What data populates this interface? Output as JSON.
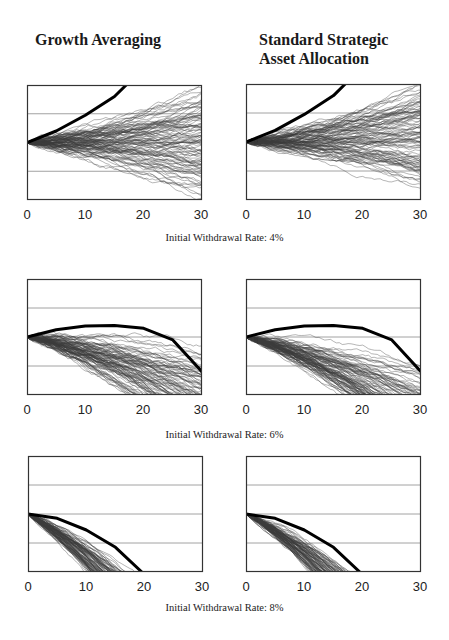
{
  "headers": {
    "left": "Growth Averaging",
    "right": "Standard Strategic Asset Allocation"
  },
  "captions": [
    "Initial Withdrawal Rate: 4%",
    "Initial Withdrawal Rate: 6%",
    "Initial Withdrawal Rate: 8%"
  ],
  "x_ticks": [
    "0",
    "10",
    "20",
    "30"
  ],
  "colors": {
    "paths": "#3a3a3a",
    "median": "#000000",
    "frame": "#333333",
    "grid": "#8a8a8a"
  },
  "chart_data": [
    {
      "type": "line",
      "title": "Growth Averaging",
      "caption": "Initial Withdrawal Rate: 4%",
      "xlabel": "Years",
      "ylabel": "",
      "xlim": [
        0,
        30
      ],
      "ylim": [
        0,
        4
      ],
      "grid": "horizontal at 1,2,3",
      "series": [
        {
          "name": "Simulated paths (~100)",
          "start": 2.0,
          "drift": 0.0,
          "vol": 0.12
        },
        {
          "name": "Expected path (thick)",
          "x": [
            0,
            5,
            10,
            15,
            17
          ],
          "y": [
            2.0,
            2.4,
            2.95,
            3.6,
            4.0
          ]
        }
      ]
    },
    {
      "type": "line",
      "title": "Standard Strategic Asset Allocation",
      "caption": "Initial Withdrawal Rate: 4%",
      "xlabel": "Years",
      "ylabel": "",
      "xlim": [
        0,
        30
      ],
      "ylim": [
        0,
        4
      ],
      "grid": "horizontal at 1,2,3",
      "series": [
        {
          "name": "Simulated paths (~100)",
          "start": 2.0,
          "drift": 0.005,
          "vol": 0.11
        },
        {
          "name": "Expected path (thick)",
          "x": [
            0,
            5,
            10,
            15,
            17
          ],
          "y": [
            2.0,
            2.4,
            2.95,
            3.6,
            4.0
          ]
        }
      ]
    },
    {
      "type": "line",
      "title": "Growth Averaging",
      "caption": "Initial Withdrawal Rate: 6%",
      "xlabel": "Years",
      "ylabel": "",
      "xlim": [
        0,
        30
      ],
      "ylim": [
        0,
        4
      ],
      "grid": "horizontal at 1,2,3",
      "series": [
        {
          "name": "Simulated paths (~100)",
          "start": 2.0,
          "drift": -0.045,
          "vol": 0.12
        },
        {
          "name": "Expected path (thick)",
          "x": [
            0,
            5,
            10,
            15,
            20,
            25,
            30
          ],
          "y": [
            2.0,
            2.25,
            2.38,
            2.4,
            2.3,
            1.9,
            0.8
          ]
        }
      ]
    },
    {
      "type": "line",
      "title": "Standard Strategic Asset Allocation",
      "caption": "Initial Withdrawal Rate: 6%",
      "xlabel": "Years",
      "ylabel": "",
      "xlim": [
        0,
        30
      ],
      "ylim": [
        0,
        4
      ],
      "grid": "horizontal at 1,2,3",
      "series": [
        {
          "name": "Simulated paths (~100)",
          "start": 2.0,
          "drift": -0.05,
          "vol": 0.1
        },
        {
          "name": "Expected path (thick)",
          "x": [
            0,
            5,
            10,
            15,
            20,
            25,
            30
          ],
          "y": [
            2.0,
            2.25,
            2.38,
            2.4,
            2.3,
            1.9,
            0.8
          ]
        }
      ]
    },
    {
      "type": "line",
      "title": "Growth Averaging",
      "caption": "Initial Withdrawal Rate: 8%",
      "xlabel": "Years",
      "ylabel": "",
      "xlim": [
        0,
        30
      ],
      "ylim": [
        0,
        4
      ],
      "grid": "horizontal at 1,2,3",
      "series": [
        {
          "name": "Simulated paths (~100)",
          "start": 2.0,
          "drift": -0.12,
          "vol": 0.1
        },
        {
          "name": "Expected path (thick)",
          "x": [
            0,
            5,
            10,
            15,
            19.5
          ],
          "y": [
            2.0,
            1.85,
            1.45,
            0.85,
            0.0
          ]
        }
      ]
    },
    {
      "type": "line",
      "title": "Standard Strategic Asset Allocation",
      "caption": "Initial Withdrawal Rate: 8%",
      "xlabel": "Years",
      "ylabel": "",
      "xlim": [
        0,
        30
      ],
      "ylim": [
        0,
        4
      ],
      "grid": "horizontal at 1,2,3",
      "series": [
        {
          "name": "Simulated paths (~100)",
          "start": 2.0,
          "drift": -0.11,
          "vol": 0.09
        },
        {
          "name": "Expected path (thick)",
          "x": [
            0,
            5,
            10,
            15,
            19.5
          ],
          "y": [
            2.0,
            1.85,
            1.45,
            0.85,
            0.0
          ]
        }
      ]
    }
  ]
}
